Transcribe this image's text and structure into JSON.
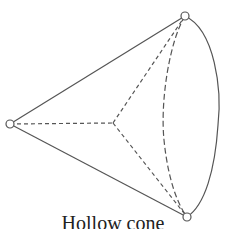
{
  "diagram": {
    "title": "Hollow cone",
    "stroke_color": "#555555",
    "apex": [
      10,
      124
    ],
    "top_vertex": [
      185,
      16
    ],
    "bottom_vertex": [
      187,
      217
    ],
    "center": [
      113,
      123
    ]
  }
}
